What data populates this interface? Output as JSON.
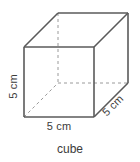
{
  "figure": {
    "caption": "cube",
    "shape_type": "cube",
    "labels": {
      "height": "5 cm",
      "width": "5 cm",
      "depth": "5 cm"
    },
    "colors": {
      "visible_edge": "#5a5a5a",
      "hidden_edge": "#9a9a9a",
      "text": "#3b3b3b",
      "background": "#ffffff"
    },
    "geometry": {
      "front_face": [
        [
          24,
          47
        ],
        [
          94,
          47
        ],
        [
          94,
          117
        ],
        [
          24,
          117
        ]
      ],
      "back_face": [
        [
          58,
          13
        ],
        [
          128,
          13
        ],
        [
          128,
          83
        ],
        [
          58,
          83
        ]
      ],
      "hidden_vertex": [
        58,
        83
      ],
      "edge_length_value": 5,
      "edge_length_unit": "cm"
    }
  }
}
